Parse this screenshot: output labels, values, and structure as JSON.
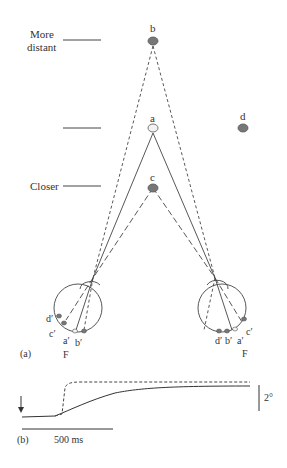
{
  "figure": {
    "panel_a": {
      "label": "(a)",
      "depth_labels": {
        "far_line1": "More",
        "far_line2": "distant",
        "closer": "Closer"
      },
      "targets": {
        "b": "b",
        "a": "a",
        "c": "c",
        "d": "d"
      },
      "colors": {
        "filled_target": "#777777",
        "open_target": "#f2f2f2",
        "line": "#444444"
      },
      "left_eye_labels": {
        "d": "d′",
        "c": "c′",
        "a": "a′",
        "b": "b′",
        "fovea": "F"
      },
      "right_eye_labels": {
        "d": "d′",
        "b": "b′",
        "a": "a′",
        "c": "c′",
        "fovea": "F"
      }
    },
    "panel_b": {
      "label": "(b)",
      "time_scale": "500 ms",
      "angle_scale": "2°"
    }
  }
}
